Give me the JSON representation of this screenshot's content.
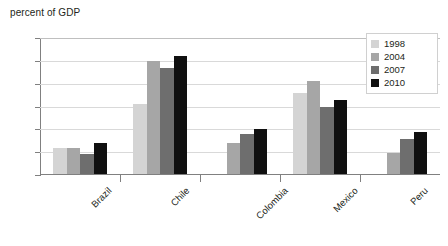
{
  "chart_data": {
    "type": "bar",
    "title": "percent of GDP",
    "xlabel": "",
    "ylabel": "percent of GDP",
    "ylim": [
      0.0,
      3.0
    ],
    "ytick_labels": [
      "3.0",
      "2.5",
      "2.0",
      "1.5",
      "1.0",
      "0.5",
      "0.0"
    ],
    "ytick_values": [
      3.0,
      2.5,
      2.0,
      1.5,
      1.0,
      0.5,
      0.0
    ],
    "grid": true,
    "legend_position": "top-right",
    "categories": [
      "Brazil",
      "Chile",
      "Colombia",
      "Mexico",
      "Peru"
    ],
    "series": [
      {
        "name": "1998",
        "color": "#d4d4d4",
        "values": [
          0.6,
          1.55,
          null,
          1.8,
          null
        ]
      },
      {
        "name": "2004",
        "color": "#a6a6a6",
        "values": [
          0.6,
          2.5,
          0.7,
          2.05,
          0.48
        ]
      },
      {
        "name": "2007",
        "color": "#6e6e6e",
        "values": [
          0.45,
          2.35,
          0.9,
          1.5,
          0.78
        ]
      },
      {
        "name": "2010",
        "color": "#101010",
        "values": [
          0.7,
          2.6,
          1.0,
          1.65,
          0.95
        ]
      }
    ]
  }
}
